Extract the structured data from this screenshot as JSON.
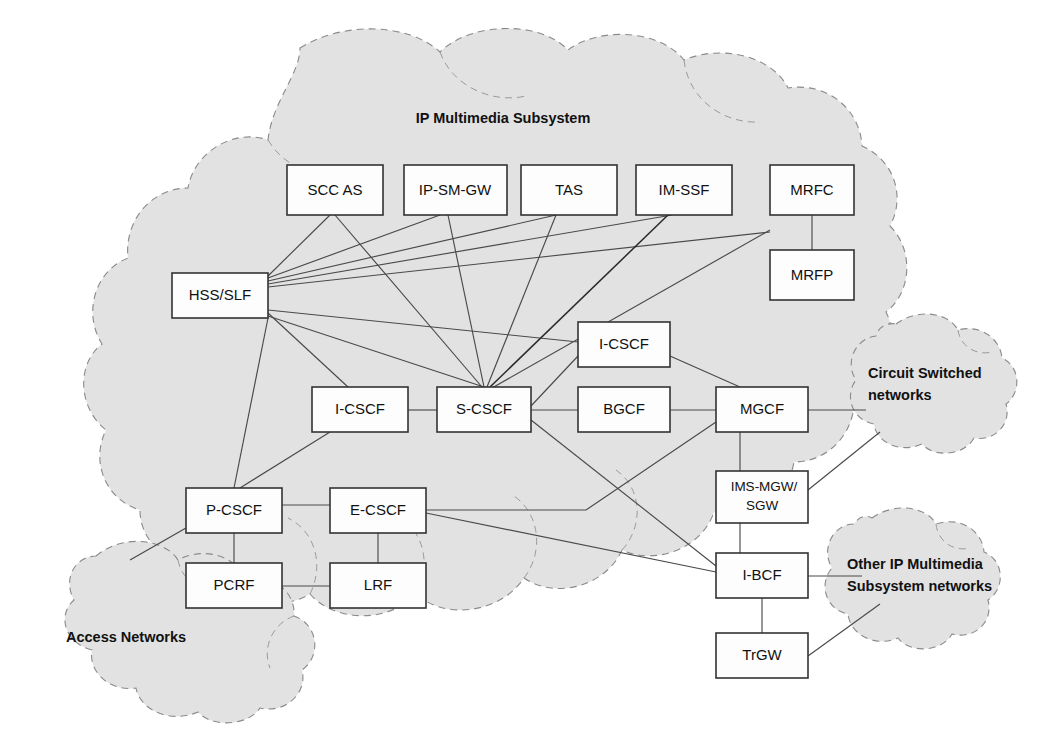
{
  "diagram": {
    "title": "IP Multimedia Subsystem",
    "title_x": 503,
    "title_y": 119,
    "width": 1054,
    "height": 734,
    "background": "#ffffff",
    "cloud_fill": "#e2e2e2",
    "cloud_stroke": "#8a8a8a",
    "box_fill": "#fdfdfd",
    "box_stroke": "#333333",
    "link_color": "#4a4a4a"
  },
  "clouds": [
    {
      "id": "ims",
      "label": "IP Multimedia Subsystem",
      "label_x": 503,
      "label_y": 119,
      "label_align": "center"
    },
    {
      "id": "circuit-switched",
      "label_line1": "Circuit Switched",
      "label_line2": "networks",
      "label_x": 868,
      "label_y": 381,
      "label_align": "start"
    },
    {
      "id": "other-ims",
      "label_line1": "Other IP Multimedia",
      "label_line2": "Subsystem networks",
      "label_x": 847,
      "label_y": 572,
      "label_align": "start"
    },
    {
      "id": "access-networks",
      "label": "Access Networks",
      "label_x": 66,
      "label_y": 638,
      "label_align": "start"
    }
  ],
  "nodes": [
    {
      "id": "scc-as",
      "label": "SCC AS",
      "x": 287,
      "y": 165,
      "w": 96,
      "h": 50
    },
    {
      "id": "ip-sm-gw",
      "label": "IP-SM-GW",
      "x": 404,
      "y": 165,
      "w": 103,
      "h": 50
    },
    {
      "id": "tas",
      "label": "TAS",
      "x": 521,
      "y": 165,
      "w": 96,
      "h": 50
    },
    {
      "id": "im-ssf",
      "label": "IM-SSF",
      "x": 636,
      "y": 165,
      "w": 96,
      "h": 50
    },
    {
      "id": "mrfc",
      "label": "MRFC",
      "x": 770,
      "y": 165,
      "w": 84,
      "h": 50
    },
    {
      "id": "mrfp",
      "label": "MRFP",
      "x": 770,
      "y": 250,
      "w": 84,
      "h": 50
    },
    {
      "id": "hss-slf",
      "label": "HSS/SLF",
      "x": 172,
      "y": 273,
      "w": 96,
      "h": 45
    },
    {
      "id": "i-cscf-upper",
      "label": "I-CSCF",
      "x": 578,
      "y": 322,
      "w": 92,
      "h": 45
    },
    {
      "id": "i-cscf-left",
      "label": "I-CSCF",
      "x": 312,
      "y": 387,
      "w": 96,
      "h": 45
    },
    {
      "id": "s-cscf",
      "label": "S-CSCF",
      "x": 437,
      "y": 387,
      "w": 94,
      "h": 45
    },
    {
      "id": "bgcf",
      "label": "BGCF",
      "x": 578,
      "y": 387,
      "w": 92,
      "h": 45
    },
    {
      "id": "mgcf",
      "label": "MGCF",
      "x": 716,
      "y": 387,
      "w": 92,
      "h": 45
    },
    {
      "id": "p-cscf",
      "label": "P-CSCF",
      "x": 186,
      "y": 488,
      "w": 96,
      "h": 45
    },
    {
      "id": "e-cscf",
      "label": "E-CSCF",
      "x": 330,
      "y": 488,
      "w": 96,
      "h": 45
    },
    {
      "id": "ims-mgw",
      "label_line1": "IMS-MGW/",
      "label_line2": "SGW",
      "x": 716,
      "y": 471,
      "w": 92,
      "h": 52
    },
    {
      "id": "pcrf",
      "label": "PCRF",
      "x": 186,
      "y": 563,
      "w": 96,
      "h": 45
    },
    {
      "id": "lrf",
      "label": "LRF",
      "x": 330,
      "y": 563,
      "w": 96,
      "h": 45
    },
    {
      "id": "i-bcf",
      "label": "I-BCF",
      "x": 716,
      "y": 553,
      "w": 92,
      "h": 45
    },
    {
      "id": "trgw",
      "label": "TrGW",
      "x": 716,
      "y": 633,
      "w": 92,
      "h": 45
    }
  ],
  "links": [
    {
      "from": "hss-slf",
      "to": "scc-as"
    },
    {
      "from": "hss-slf",
      "to": "ip-sm-gw"
    },
    {
      "from": "hss-slf",
      "to": "tas"
    },
    {
      "from": "hss-slf",
      "to": "im-ssf"
    },
    {
      "from": "hss-slf",
      "to": "mrfc"
    },
    {
      "from": "hss-slf",
      "to": "s-cscf"
    },
    {
      "from": "hss-slf",
      "to": "i-cscf-left"
    },
    {
      "from": "hss-slf",
      "to": "i-cscf-upper"
    },
    {
      "from": "hss-slf",
      "to": "p-cscf"
    },
    {
      "from": "scc-as",
      "to": "s-cscf"
    },
    {
      "from": "ip-sm-gw",
      "to": "s-cscf"
    },
    {
      "from": "tas",
      "to": "s-cscf"
    },
    {
      "from": "im-ssf",
      "to": "s-cscf"
    },
    {
      "from": "mrfc",
      "to": "s-cscf"
    },
    {
      "from": "mrfc",
      "to": "mrfp"
    },
    {
      "from": "i-cscf-left",
      "to": "s-cscf"
    },
    {
      "from": "s-cscf",
      "to": "bgcf"
    },
    {
      "from": "s-cscf",
      "to": "i-cscf-upper"
    },
    {
      "from": "s-cscf",
      "to": "mgcf"
    },
    {
      "from": "s-cscf",
      "to": "i-bcf"
    },
    {
      "from": "bgcf",
      "to": "mgcf"
    },
    {
      "from": "i-cscf-upper",
      "to": "mgcf"
    },
    {
      "from": "mgcf",
      "to": "ims-mgw"
    },
    {
      "from": "mgcf",
      "to": "circuit-switched-cloud"
    },
    {
      "from": "ims-mgw",
      "to": "circuit-switched-cloud"
    },
    {
      "from": "ims-mgw",
      "to": "i-bcf"
    },
    {
      "from": "i-bcf",
      "to": "other-ims-cloud"
    },
    {
      "from": "i-bcf",
      "to": "trgw"
    },
    {
      "from": "trgw",
      "to": "other-ims-cloud"
    },
    {
      "from": "e-cscf",
      "to": "mgcf"
    },
    {
      "from": "e-cscf",
      "to": "i-bcf"
    },
    {
      "from": "e-cscf",
      "to": "p-cscf"
    },
    {
      "from": "e-cscf",
      "to": "lrf"
    },
    {
      "from": "p-cscf",
      "to": "pcrf"
    },
    {
      "from": "p-cscf",
      "to": "access-networks-cloud"
    },
    {
      "from": "pcrf",
      "to": "lrf"
    },
    {
      "from": "i-cscf-left",
      "to": "p-cscf"
    }
  ]
}
